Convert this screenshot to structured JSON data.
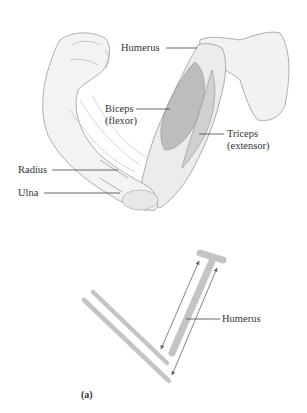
{
  "figure": {
    "panel_label": "(a)",
    "illustration": {
      "labels": {
        "humerus": "Humerus",
        "biceps_line1": "Biceps",
        "biceps_line2": "(flexor)",
        "triceps_line1": "Triceps",
        "triceps_line2": "(extensor)",
        "radius": "Radius",
        "ulna": "Ulna"
      }
    },
    "schematic": {
      "humerus_label": "Humerus"
    },
    "colors": {
      "bone_bar": "#c4c4c4",
      "muscle_shade": "#b9b9b9",
      "line": "#555555",
      "arrow": "#666666",
      "skin_outline": "#9a9a9a",
      "skin_fill": "#f4f4f4"
    }
  }
}
